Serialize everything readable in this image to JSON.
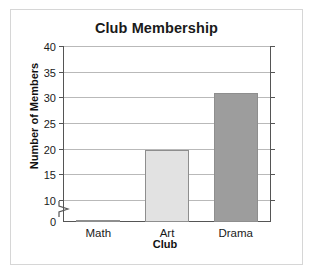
{
  "chart_data": {
    "type": "bar",
    "title": "Club Membership",
    "xlabel": "Club",
    "ylabel": "Number of Members",
    "categories": [
      "Math",
      "Art",
      "Drama"
    ],
    "values": [
      2,
      20,
      31
    ],
    "series": [
      {
        "name": "Number of Members",
        "values": [
          2,
          20,
          31
        ]
      }
    ],
    "ylim": [
      0,
      40
    ],
    "yticks": [
      0,
      10,
      15,
      20,
      25,
      30,
      35,
      40
    ],
    "ytick_labels": [
      "0",
      "10",
      "15",
      "20",
      "25",
      "30",
      "35",
      "40"
    ],
    "grid": true,
    "legend": false,
    "axis_break": {
      "present": true,
      "between": [
        0,
        10
      ],
      "axis": "y"
    },
    "bar_colors": [
      "#6e6e6e",
      "#e2e2e2",
      "#9d9d9d"
    ],
    "annotations": []
  },
  "figure": {
    "frame_border_color": "#d6d6d6",
    "axis_color": "#555555",
    "gridline_color": "#b9b9b9",
    "background": "#ffffff",
    "text_color": "#1a1a1a"
  }
}
